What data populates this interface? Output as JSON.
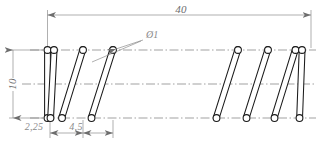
{
  "drawing": {
    "title": "Helical compression spring – technical drawing",
    "type": "mechanical-part-drawing",
    "colors": {
      "outline": "#1a1a1a",
      "centerline": "#7a7a7a",
      "dimension_line": "#7a7a7a",
      "dimension_text": "#6d6d6d",
      "background": "#ffffff",
      "wire_fill": "#ffffff"
    },
    "dimensions": [
      {
        "id": "overall-length",
        "label": "40",
        "orientation": "horizontal",
        "position": "top",
        "from_x": 47,
        "to_x": 311,
        "line_y": 15,
        "text_x": 181,
        "text_y": 13
      },
      {
        "id": "outer-diameter",
        "label": "10",
        "orientation": "vertical",
        "position": "left",
        "from_y": 50,
        "to_y": 118,
        "line_x": 13,
        "text_x": 13,
        "text_y": 84
      },
      {
        "id": "end-pitch",
        "label": "2,25",
        "orientation": "horizontal",
        "position": "bottom",
        "from_x": 50,
        "to_x": 83,
        "line_y": 133,
        "text_x": 34,
        "text_y": 130
      },
      {
        "id": "coil-pitch",
        "label": "4,5",
        "orientation": "horizontal",
        "position": "bottom",
        "from_x": 83,
        "to_x": 113,
        "line_y": 133,
        "text_x": 76,
        "text_y": 130
      }
    ],
    "callouts": [
      {
        "id": "wire-diameter",
        "label": "Ø1",
        "text_x": 146,
        "text_y": 38,
        "leader_from_x": 137,
        "leader_from_y": 42,
        "leader_to_x": 115,
        "leader_to_y": 50,
        "leader2_to_x": 92,
        "leader2_to_y": 62
      }
    ],
    "axes": [
      {
        "id": "top-envelope-line",
        "y": 50,
        "x1": 30,
        "x2": 316
      },
      {
        "id": "center-axis-line",
        "y": 84,
        "x1": 22,
        "x2": 316
      },
      {
        "id": "bottom-envelope-line",
        "y": 118,
        "x1": 30,
        "x2": 316
      }
    ],
    "spring": {
      "wire_radius": 3.6,
      "wire_thickness": 2.4,
      "top_y": 50,
      "bottom_y": 118,
      "break_gap": {
        "from_x": 126,
        "to_x": 228
      },
      "coils": [
        {
          "id": "coil-1-end",
          "top_x": 47.5,
          "bottom_x": 47.5,
          "kind": "end"
        },
        {
          "id": "coil-2",
          "top_x": 54.0,
          "bottom_x": 50.5,
          "kind": "end"
        },
        {
          "id": "coil-3",
          "top_x": 83.0,
          "bottom_x": 62.0,
          "kind": "body"
        },
        {
          "id": "coil-4",
          "top_x": 113.0,
          "bottom_x": 91.5,
          "kind": "body"
        },
        {
          "id": "coil-5",
          "top_x": 238.0,
          "bottom_x": 216.5,
          "kind": "body"
        },
        {
          "id": "coil-6",
          "top_x": 268.0,
          "bottom_x": 246.5,
          "kind": "body"
        },
        {
          "id": "coil-7",
          "top_x": 295.5,
          "bottom_x": 274.5,
          "kind": "body"
        },
        {
          "id": "coil-8-end",
          "top_x": 302.0,
          "bottom_x": 299.5,
          "kind": "end"
        }
      ]
    }
  }
}
